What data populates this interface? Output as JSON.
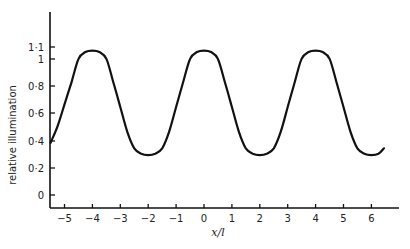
{
  "chart_data": {
    "type": "line",
    "title": "",
    "xlabel": "x/l",
    "ylabel": "relative illumination",
    "xlim": [
      -5.5,
      7
    ],
    "ylim": [
      -0.1,
      1.3
    ],
    "grid": false,
    "legend": null,
    "x_ticks": [
      -5,
      -4,
      -3,
      -2,
      -1,
      0,
      1,
      2,
      3,
      4,
      5,
      6
    ],
    "x_tick_labels": [
      "−5",
      "−4",
      "−3",
      "−2",
      "−1",
      "0",
      "1",
      "2",
      "3",
      "4",
      "5",
      "6"
    ],
    "y_ticks": [
      0,
      0.2,
      0.4,
      0.6,
      0.8,
      1,
      1.1
    ],
    "y_tick_labels": [
      "0",
      "0·2",
      "0·4",
      "0·6",
      "0·8",
      "1",
      "1·1"
    ],
    "series": [
      {
        "name": "relative illumination",
        "x": [
          -5.5,
          -5.25,
          -5.0,
          -4.75,
          -4.5,
          -4.25,
          -4.0,
          -3.75,
          -3.5,
          -3.25,
          -3.0,
          -2.75,
          -2.5,
          -2.25,
          -2.0,
          -1.75,
          -1.5,
          -1.25,
          -1.0,
          -0.75,
          -0.5,
          -0.25,
          0.0,
          0.25,
          0.5,
          0.75,
          1.0,
          1.25,
          1.5,
          1.75,
          2.0,
          2.25,
          2.5,
          2.75,
          3.0,
          3.25,
          3.5,
          3.75,
          4.0,
          4.25,
          4.5,
          4.75,
          5.0,
          5.25,
          5.5,
          5.75,
          6.0,
          6.25,
          6.45
        ],
        "y": [
          0.38,
          0.5,
          0.66,
          0.82,
          0.99,
          1.04,
          1.05,
          1.04,
          0.99,
          0.82,
          0.64,
          0.46,
          0.34,
          0.3,
          0.29,
          0.3,
          0.34,
          0.46,
          0.64,
          0.82,
          0.99,
          1.04,
          1.05,
          1.04,
          0.99,
          0.82,
          0.64,
          0.46,
          0.34,
          0.3,
          0.29,
          0.3,
          0.34,
          0.46,
          0.64,
          0.82,
          0.99,
          1.04,
          1.05,
          1.04,
          0.99,
          0.82,
          0.64,
          0.46,
          0.34,
          0.3,
          0.29,
          0.3,
          0.34
        ]
      }
    ]
  },
  "axes": {
    "x_title": "x/l",
    "y_title": "relative illumination"
  }
}
